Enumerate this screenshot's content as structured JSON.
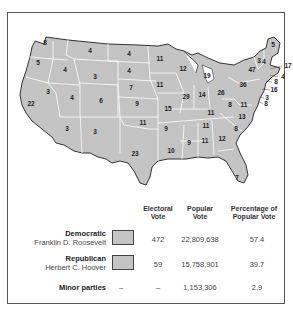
{
  "map": {
    "fill_color": "#c4c4c4",
    "border_color": "#ffffff",
    "outline_color": "#333333",
    "states": [
      {
        "abbr": "WA",
        "ev": "8",
        "x": 37,
        "y": 30
      },
      {
        "abbr": "OR",
        "ev": "5",
        "x": 30,
        "y": 50
      },
      {
        "abbr": "CA",
        "ev": "22",
        "x": 23,
        "y": 91
      },
      {
        "abbr": "ID",
        "ev": "4",
        "x": 57,
        "y": 57
      },
      {
        "abbr": "NV",
        "ev": "3",
        "x": 40,
        "y": 79
      },
      {
        "abbr": "MT",
        "ev": "4",
        "x": 82,
        "y": 38
      },
      {
        "abbr": "WY",
        "ev": "3",
        "x": 87,
        "y": 64
      },
      {
        "abbr": "UT",
        "ev": "4",
        "x": 64,
        "y": 85
      },
      {
        "abbr": "CO",
        "ev": "6",
        "x": 93,
        "y": 88
      },
      {
        "abbr": "AZ",
        "ev": "3",
        "x": 59,
        "y": 116
      },
      {
        "abbr": "NM",
        "ev": "3",
        "x": 87,
        "y": 119
      },
      {
        "abbr": "ND",
        "ev": "4",
        "x": 121,
        "y": 41
      },
      {
        "abbr": "SD",
        "ev": "4",
        "x": 121,
        "y": 58
      },
      {
        "abbr": "NE",
        "ev": "7",
        "x": 123,
        "y": 75
      },
      {
        "abbr": "KS",
        "ev": "9",
        "x": 129,
        "y": 91
      },
      {
        "abbr": "OK",
        "ev": "11",
        "x": 135,
        "y": 110
      },
      {
        "abbr": "TX",
        "ev": "23",
        "x": 127,
        "y": 141
      },
      {
        "abbr": "MN",
        "ev": "11",
        "x": 152,
        "y": 46
      },
      {
        "abbr": "IA",
        "ev": "11",
        "x": 152,
        "y": 72
      },
      {
        "abbr": "MO",
        "ev": "15",
        "x": 160,
        "y": 96
      },
      {
        "abbr": "AR",
        "ev": "9",
        "x": 158,
        "y": 116
      },
      {
        "abbr": "LA",
        "ev": "10",
        "x": 163,
        "y": 138
      },
      {
        "abbr": "WI",
        "ev": "12",
        "x": 175,
        "y": 56
      },
      {
        "abbr": "IL",
        "ev": "29",
        "x": 178,
        "y": 84
      },
      {
        "abbr": "MI",
        "ev": "19",
        "x": 199,
        "y": 63
      },
      {
        "abbr": "IN",
        "ev": "14",
        "x": 194,
        "y": 82
      },
      {
        "abbr": "OH",
        "ev": "26",
        "x": 213,
        "y": 80
      },
      {
        "abbr": "KY",
        "ev": "11",
        "x": 203,
        "y": 100
      },
      {
        "abbr": "TN",
        "ev": "11",
        "x": 198,
        "y": 113
      },
      {
        "abbr": "MS",
        "ev": "9",
        "x": 181,
        "y": 130
      },
      {
        "abbr": "AL",
        "ev": "11",
        "x": 197,
        "y": 128
      },
      {
        "abbr": "GA",
        "ev": "12",
        "x": 214,
        "y": 126
      },
      {
        "abbr": "FL",
        "ev": "7",
        "x": 229,
        "y": 165
      },
      {
        "abbr": "SC",
        "ev": "8",
        "x": 228,
        "y": 116
      },
      {
        "abbr": "NC",
        "ev": "13",
        "x": 234,
        "y": 104
      },
      {
        "abbr": "VA",
        "ev": "11",
        "x": 236,
        "y": 92
      },
      {
        "abbr": "WV",
        "ev": "8",
        "x": 222,
        "y": 92
      },
      {
        "abbr": "PA",
        "ev": "36",
        "x": 235,
        "y": 72
      },
      {
        "abbr": "NY",
        "ev": "47",
        "x": 244,
        "y": 57
      },
      {
        "abbr": "VT",
        "ev": "3",
        "x": 251,
        "y": 48
      },
      {
        "abbr": "NH",
        "ev": "4",
        "x": 256,
        "y": 49
      },
      {
        "abbr": "ME",
        "ev": "5",
        "x": 265,
        "y": 32
      },
      {
        "abbr": "MA",
        "ev": "17",
        "x": 280,
        "y": 53,
        "callout": true
      },
      {
        "abbr": "RI",
        "ev": "4",
        "x": 275,
        "y": 64,
        "callout": true
      },
      {
        "abbr": "CT",
        "ev": "8",
        "x": 268,
        "y": 69,
        "callout": true
      },
      {
        "abbr": "NJ",
        "ev": "16",
        "x": 266,
        "y": 77,
        "callout": true
      },
      {
        "abbr": "DE",
        "ev": "3",
        "x": 259,
        "y": 85,
        "callout": true
      },
      {
        "abbr": "MD",
        "ev": "8",
        "x": 258,
        "y": 91,
        "callout": true
      }
    ]
  },
  "legend": {
    "headers": {
      "electoral": "Electoral Vote",
      "popular": "Popular Vote",
      "percentage": "Percentage of Popular Vote"
    },
    "rows": [
      {
        "party": "Democratic",
        "candidate": "Franklin D. Roosevelt",
        "swatch": "#c4c4c4",
        "electoral": "472",
        "popular": "22,809,638",
        "percentage": "57.4"
      },
      {
        "party": "Republican",
        "candidate": "Herbert C. Hoover",
        "swatch": "#c4c4c4",
        "electoral": "59",
        "popular": "15,758,901",
        "percentage": "39.7"
      },
      {
        "party": "Minor parties",
        "candidate": "",
        "swatch": "",
        "electoral": "–",
        "popular": "1,153,306",
        "percentage": "2.9",
        "swatch_dash": "–"
      }
    ]
  }
}
